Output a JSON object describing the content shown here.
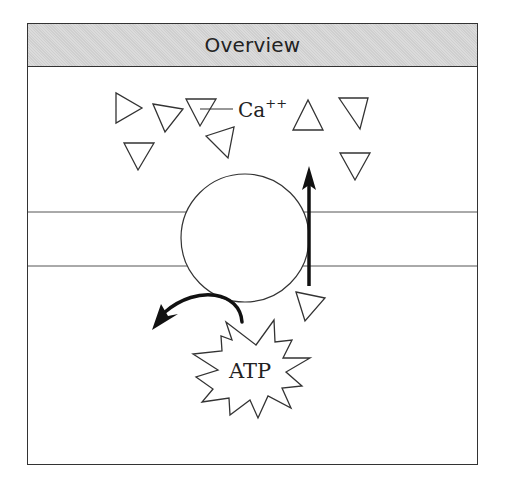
{
  "header": {
    "title": "Overview"
  },
  "labels": {
    "ion": "Ca",
    "ion_charge": "++",
    "energy": "ATP"
  },
  "colors": {
    "stroke": "#222222",
    "header_fill": "#cfcfcf",
    "background": "#ffffff"
  },
  "elements": {
    "ions": "triangles representing Ca++ ions",
    "pump": "circle representing membrane pump",
    "membrane": "two horizontal lines",
    "transport_arrow": "upward arrow through membrane",
    "atp_arrow": "curved arrow from ATP"
  }
}
